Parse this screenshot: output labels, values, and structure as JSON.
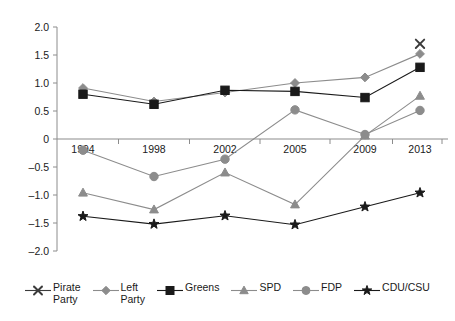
{
  "chart_data": {
    "type": "line",
    "title": "",
    "xlabel": "",
    "ylabel": "",
    "categories": [
      "1994",
      "1998",
      "2002",
      "2005",
      "2009",
      "2013"
    ],
    "ylim": [
      -2.0,
      2.0
    ],
    "yticks": [
      "2.0",
      "1.5",
      "1.0",
      "0.5",
      "0",
      "-0.5",
      "-1.0",
      "-1.5",
      "-2.0"
    ],
    "ytick_values": [
      2.0,
      1.5,
      1.0,
      0.5,
      0,
      -0.5,
      -1.0,
      -1.5,
      -2.0
    ],
    "grid": false,
    "legend_position": "bottom",
    "zero_line": true,
    "series": [
      {
        "name": "Pirate Party",
        "legend_label": "Pirate\nParty",
        "marker": "x",
        "color": "#3b3b3b",
        "values": [
          null,
          null,
          null,
          null,
          null,
          1.7
        ]
      },
      {
        "name": "Left Party",
        "legend_label": "Left\nParty",
        "marker": "diamond",
        "color": "#8c8c8c",
        "values": [
          0.91,
          0.67,
          0.83,
          1.0,
          1.1,
          1.52
        ]
      },
      {
        "name": "Greens",
        "legend_label": "Greens",
        "marker": "square",
        "color": "#1a1a1a",
        "values": [
          0.8,
          0.62,
          0.87,
          0.85,
          0.74,
          1.28
        ]
      },
      {
        "name": "SPD",
        "legend_label": "SPD",
        "marker": "triangle",
        "color": "#8c8c8c",
        "values": [
          -0.96,
          -1.26,
          -0.6,
          -1.17,
          0.06,
          0.77
        ]
      },
      {
        "name": "FDP",
        "legend_label": "FDP",
        "marker": "circle",
        "color": "#8c8c8c",
        "values": [
          -0.2,
          -0.67,
          -0.36,
          0.52,
          0.08,
          0.51
        ]
      },
      {
        "name": "CDU/CSU",
        "legend_label": "CDU/CSU",
        "marker": "star",
        "color": "#1a1a1a",
        "values": [
          -1.38,
          -1.52,
          -1.37,
          -1.53,
          -1.21,
          -0.96
        ]
      }
    ]
  },
  "axis": {
    "axis_color": "#8c8c8c",
    "text_color": "#1a1a1a"
  }
}
